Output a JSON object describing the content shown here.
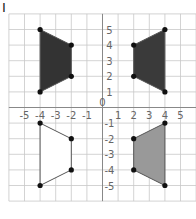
{
  "question_label": "I",
  "grid": {
    "x_min": -6,
    "x_max": 6,
    "y_min": -6,
    "y_max": 6,
    "origin_label": "0",
    "x_tick_labels": [
      "-5",
      "-4",
      "-3",
      "-2",
      "-1",
      "1",
      "2",
      "3",
      "4",
      "5"
    ],
    "y_tick_labels": [
      "5",
      "4",
      "3",
      "2",
      "1",
      "-1",
      "-2",
      "-3",
      "-4",
      "-5"
    ],
    "grid_color": "#c8c8c8",
    "axis_color": "#888888"
  },
  "shapes": [
    {
      "name": "top-left-trapezoid",
      "fill": "#333333",
      "vertices": [
        [
          -4,
          5
        ],
        [
          -2,
          4
        ],
        [
          -2,
          2
        ],
        [
          -4,
          1
        ]
      ]
    },
    {
      "name": "top-right-trapezoid",
      "fill": "#3a3a3a",
      "vertices": [
        [
          2,
          4
        ],
        [
          4,
          5
        ],
        [
          4,
          1
        ],
        [
          2,
          2
        ]
      ]
    },
    {
      "name": "bottom-left-trapezoid",
      "fill": "#ffffff",
      "vertices": [
        [
          -4,
          -1
        ],
        [
          -2,
          -2
        ],
        [
          -2,
          -4
        ],
        [
          -4,
          -5
        ]
      ]
    },
    {
      "name": "bottom-right-trapezoid",
      "fill": "#999999",
      "vertices": [
        [
          2,
          -2
        ],
        [
          4,
          -1
        ],
        [
          4,
          -5
        ],
        [
          2,
          -4
        ]
      ]
    }
  ],
  "chart_data": {
    "type": "scatter",
    "title": "",
    "xlabel": "",
    "ylabel": "",
    "xlim": [
      -6,
      6
    ],
    "ylim": [
      -6,
      6
    ],
    "grid": true,
    "series": [
      {
        "name": "Quadrant II (dark)",
        "x": [
          -4,
          -2,
          -2,
          -4
        ],
        "y": [
          5,
          4,
          2,
          1
        ]
      },
      {
        "name": "Quadrant I (dark)",
        "x": [
          2,
          4,
          4,
          2
        ],
        "y": [
          4,
          5,
          1,
          2
        ]
      },
      {
        "name": "Quadrant III (white)",
        "x": [
          -4,
          -2,
          -2,
          -4
        ],
        "y": [
          -1,
          -2,
          -4,
          -5
        ]
      },
      {
        "name": "Quadrant IV (grey)",
        "x": [
          2,
          4,
          4,
          2
        ],
        "y": [
          -2,
          -1,
          -5,
          -4
        ]
      }
    ]
  }
}
